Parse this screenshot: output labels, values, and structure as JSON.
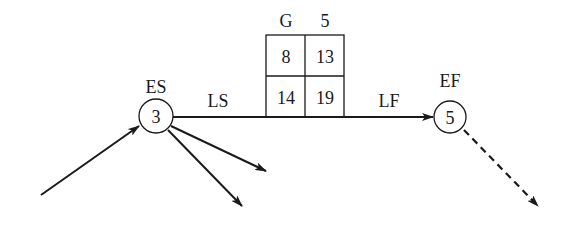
{
  "diagram": {
    "type": "activity-on-arrow network node",
    "activity": {
      "name": "G",
      "duration": "5",
      "early_start": "8",
      "early_finish": "13",
      "late_start": "14",
      "late_finish": "19"
    },
    "start_node": {
      "number": "3",
      "label": "ES"
    },
    "end_node": {
      "number": "5",
      "label": "EF"
    },
    "arrow_labels": {
      "left": "LS",
      "right": "LF"
    },
    "colors": {
      "ink": "#1a1a1a",
      "background": "#ffffff"
    }
  }
}
